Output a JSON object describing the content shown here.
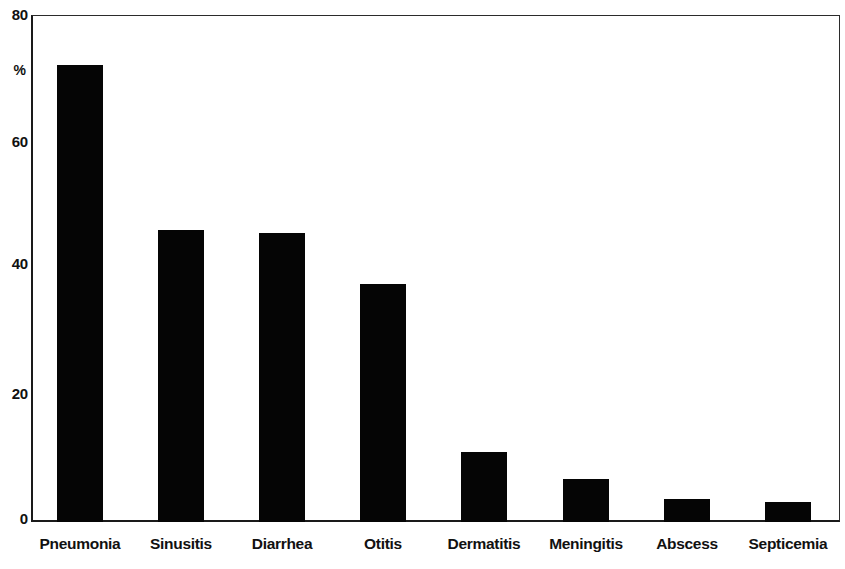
{
  "chart_data": {
    "type": "bar",
    "title": "",
    "subtitle": "",
    "xlabel": "",
    "ylabel": "%",
    "ylim": [
      0,
      80
    ],
    "yticks": [
      0,
      20,
      40,
      60,
      80
    ],
    "ytick_labels": [
      "0",
      "20",
      "40",
      "60",
      "80"
    ],
    "grid": false,
    "legend": null,
    "bar_color": "#050505",
    "background_color": "#ffffff",
    "frame_color": "#1a1a1a",
    "categories": [
      "Pneumonia",
      "Sinusitis",
      "Diarrhea",
      "Otitis",
      "Dermatitis",
      "Meningitis",
      "Abscess",
      "Septicemia"
    ],
    "values": [
      72,
      46,
      45.5,
      37.5,
      11,
      6.8,
      3.6,
      3.2
    ],
    "value_unit": "%"
  },
  "axis": {
    "y_unit_label": "%",
    "y_tick_80": "80",
    "y_tick_60": "60",
    "y_tick_40": "40",
    "y_tick_20": "20",
    "y_tick_0": "0"
  }
}
